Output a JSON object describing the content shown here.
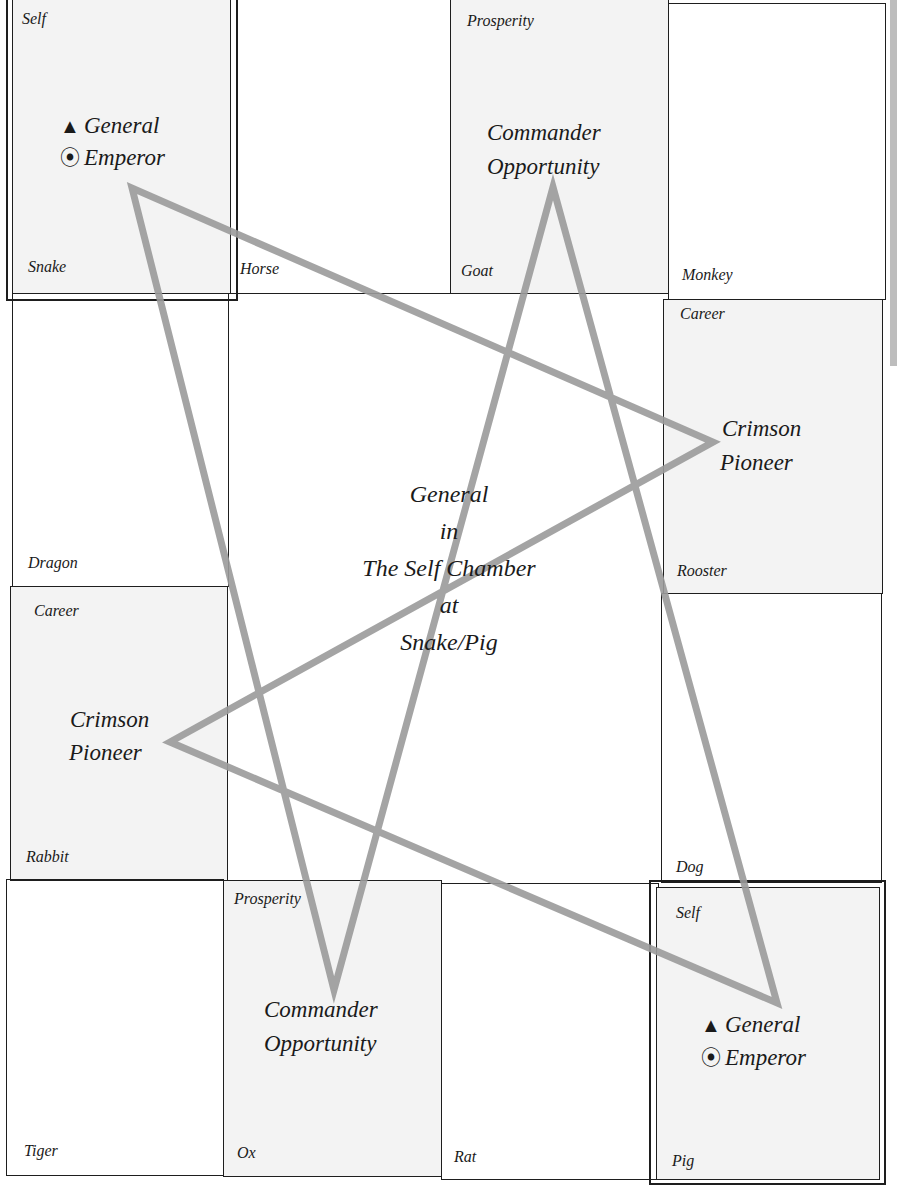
{
  "center": {
    "lines": [
      "General",
      "in",
      "The Self Chamber",
      "at",
      "Snake/Pig"
    ]
  },
  "cells": {
    "snake": {
      "animal": "Snake",
      "palace": "Self",
      "general": "General",
      "emperor": "Emperor"
    },
    "horse": {
      "animal": "Horse"
    },
    "goat": {
      "animal": "Goat",
      "palace": "Prosperity",
      "line1": "Commander",
      "line2": "Opportunity"
    },
    "monkey": {
      "animal": "Monkey"
    },
    "dragon": {
      "animal": "Dragon"
    },
    "rooster": {
      "animal": "Rooster",
      "palace": "Career",
      "line1": "Crimson",
      "line2": "Pioneer"
    },
    "rabbit": {
      "animal": "Rabbit",
      "palace": "Career",
      "line1": "Crimson",
      "line2": "Pioneer"
    },
    "dog": {
      "animal": "Dog"
    },
    "tiger": {
      "animal": "Tiger"
    },
    "ox": {
      "animal": "Ox",
      "palace": "Prosperity",
      "line1": "Commander",
      "line2": "Opportunity"
    },
    "rat": {
      "animal": "Rat"
    },
    "pig": {
      "animal": "Pig",
      "palace": "Self",
      "general": "General",
      "emperor": "Emperor"
    }
  },
  "icons": {
    "general_symbol": "▲",
    "emperor_symbol": "⦿"
  },
  "colors": {
    "grid_line": "#1e1e1e",
    "shaded_cell": "#f3f3f3",
    "star_line": "#9a9a9a"
  },
  "star_points": "132,188 334,990 553,187 777,1003 170,742 713,442"
}
